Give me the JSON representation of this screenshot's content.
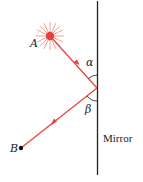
{
  "diagram": {
    "labels": {
      "source": "A",
      "endpoint": "B",
      "incident_angle": "α",
      "reflected_angle": "β",
      "mirror": "Mirror"
    },
    "colors": {
      "ray": "#e8403a",
      "mirror": "#222222",
      "angle_arc": "#333333"
    }
  }
}
